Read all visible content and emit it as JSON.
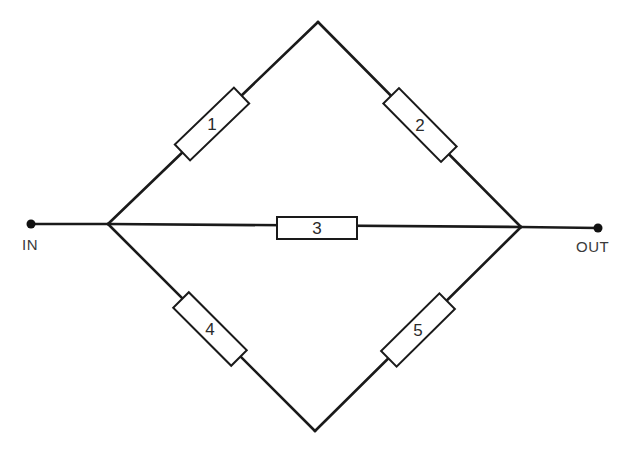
{
  "diagram": {
    "type": "bridge-network",
    "terminals": {
      "in": {
        "label": "IN"
      },
      "out": {
        "label": "OUT"
      }
    },
    "nodes": {
      "left": [
        108,
        224
      ],
      "right": [
        521,
        227
      ],
      "top": [
        318,
        22
      ],
      "bottom": [
        315,
        431
      ]
    },
    "resistors": [
      {
        "id": "1",
        "label": "1",
        "from": "left",
        "to": "top"
      },
      {
        "id": "2",
        "label": "2",
        "from": "top",
        "to": "right"
      },
      {
        "id": "3",
        "label": "3",
        "from": "left",
        "to": "right"
      },
      {
        "id": "4",
        "label": "4",
        "from": "left",
        "to": "bottom"
      },
      {
        "id": "5",
        "label": "5",
        "from": "bottom",
        "to": "right"
      }
    ],
    "colors": {
      "line": "#1a1a1a",
      "background": "#ffffff"
    }
  }
}
